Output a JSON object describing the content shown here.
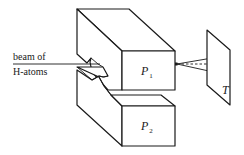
{
  "diagram": {
    "type": "Stern-Gerlach apparatus",
    "labels": {
      "beam_line1": "beam of",
      "beam_line2": "H-atoms",
      "magnet_upper": {
        "main": "P",
        "sub": "1"
      },
      "magnet_lower": {
        "main": "P",
        "sub": "2"
      },
      "target": "T"
    },
    "colors": {
      "stroke": "#1a1a1a",
      "background": "#ffffff"
    }
  }
}
